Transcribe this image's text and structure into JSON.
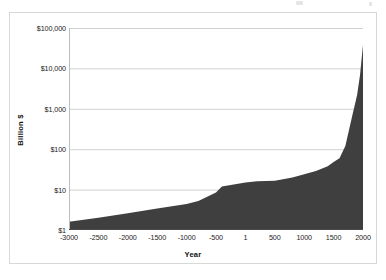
{
  "figure": {
    "frame_border_color": "#d8d8d8",
    "background": "#ffffff"
  },
  "chart_data": {
    "type": "area",
    "title": "",
    "subtitle": "",
    "xlabel": "Year",
    "ylabel": "Billion $",
    "series": [
      {
        "name": "Billion $",
        "color": "#3f3f3f",
        "x": [
          -3000,
          -2500,
          -2000,
          -1500,
          -1000,
          -800,
          -500,
          -400,
          1,
          200,
          500,
          800,
          1000,
          1200,
          1400,
          1500,
          1600,
          1700,
          1820,
          1900,
          1950,
          2000
        ],
        "values": [
          1.6,
          2.0,
          2.6,
          3.4,
          4.4,
          5.2,
          8.5,
          12.0,
          15.0,
          16.0,
          16.5,
          20.0,
          24.0,
          29.0,
          38.0,
          48.0,
          60.0,
          120.0,
          700.0,
          2200.0,
          7000.0,
          38000.0
        ]
      }
    ],
    "x_ticks": [
      -3000,
      -2500,
      -2000,
      -1500,
      -1000,
      -500,
      1,
      500,
      1000,
      1500,
      2000
    ],
    "x_tick_labels": [
      "-3000",
      "-2500",
      "-2000",
      "-1500",
      "-1000",
      "-500",
      "1",
      "500",
      "1000",
      "1500",
      "2000"
    ],
    "xlim": [
      -3000,
      2000
    ],
    "y_scale": "log",
    "y_ticks": [
      1,
      10,
      100,
      1000,
      10000,
      100000
    ],
    "y_tick_labels": [
      "$1",
      "$10",
      "$100",
      "$1,000",
      "$10,000",
      "$100,000"
    ],
    "ylim": [
      1,
      100000
    ],
    "grid": "horizontal",
    "gridline_color": "#d0d0d0",
    "legend": "none",
    "annotations": []
  }
}
